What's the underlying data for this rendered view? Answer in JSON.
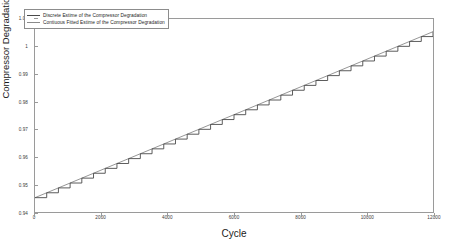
{
  "chart_data": {
    "type": "line",
    "title": "",
    "xlabel": "Cycle",
    "ylabel": "Compressor Degradation",
    "xlim": [
      0,
      12000
    ],
    "ylim": [
      0.94,
      1.01
    ],
    "grid": false,
    "legend_position": "upper-left",
    "xticks": [
      0,
      2000,
      4000,
      6000,
      8000,
      10000,
      12000
    ],
    "xtick_labels": [
      "0",
      "2000",
      "4000",
      "6000",
      "8000",
      "10000",
      "12000"
    ],
    "yticks": [
      0.94,
      0.95,
      0.96,
      0.97,
      0.98,
      0.99,
      1,
      1.01
    ],
    "ytick_labels": [
      "0.94",
      "0.95",
      "0.96",
      "0.97",
      "0.98",
      "0.99",
      "1",
      "1.01"
    ],
    "series": [
      {
        "name": "Discrete Estime of the Compressor Degradation",
        "color": "#4a4a4a",
        "style": "staircase",
        "steps": 34,
        "x": [
          0,
          12000
        ],
        "values": [
          0.9452,
          1.0054
        ]
      },
      {
        "name": "Contiuous Fitted Estime of the Compressor Degradation",
        "color": "#8a8a8a",
        "style": "solid",
        "x": [
          0,
          12000
        ],
        "values": [
          0.9452,
          1.0054
        ]
      }
    ]
  },
  "legend": {
    "items": [
      {
        "label": "Discrete Estime of the Compressor Degradation",
        "color": "#4a4a4a"
      },
      {
        "label": "Contiuous Fitted Estime of the Compressor Degradation",
        "color": "#8a8a8a"
      }
    ]
  }
}
